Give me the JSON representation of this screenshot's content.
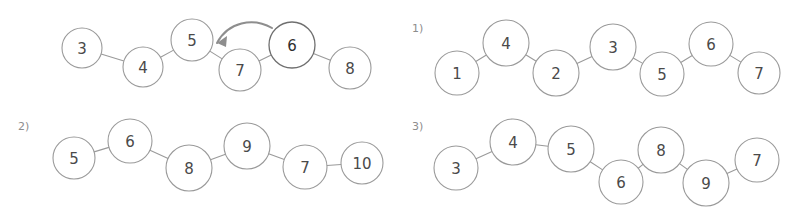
{
  "canvas": {
    "width": 791,
    "height": 213,
    "background": "#ffffff"
  },
  "style": {
    "node_stroke": "#9a9a9a",
    "node_fill": "#ffffff",
    "label_color": "#4a4a4a",
    "edge_color": "#9a9a9a",
    "panel_label_color": "#8d8d8d",
    "arrow_color": "#8e8e8e",
    "shaded_fill": "#8f8f8f",
    "hatch_color": "#d8d8d8"
  },
  "panels": [
    {
      "id": "panel-main",
      "label": "",
      "nodes": [
        {
          "value": "3",
          "cx": 82,
          "cy": 48,
          "r": 20,
          "shaded": false
        },
        {
          "value": "4",
          "cx": 143,
          "cy": 67,
          "r": 20,
          "shaded": false
        },
        {
          "value": "5",
          "cx": 192,
          "cy": 40,
          "r": 21,
          "shaded": false
        },
        {
          "value": "7",
          "cx": 240,
          "cy": 70,
          "r": 21,
          "shaded": false
        },
        {
          "value": "6",
          "cx": 292,
          "cy": 45,
          "r": 23,
          "shaded": true
        },
        {
          "value": "8",
          "cx": 350,
          "cy": 68,
          "r": 21,
          "shaded": false
        }
      ],
      "edges": [
        {
          "from": 0,
          "to": 1
        },
        {
          "from": 1,
          "to": 2
        },
        {
          "from": 2,
          "to": 3
        },
        {
          "from": 3,
          "to": 4
        },
        {
          "from": 4,
          "to": 5
        }
      ],
      "arrow": {
        "label": "move-6-left-arrow",
        "from_node": "6",
        "to_between": "5-and-7",
        "path": "M 272 28 C 253 17 228 22 217 43",
        "head": "217,43 227,36 226,47"
      }
    },
    {
      "id": "panel-1",
      "label": "1)",
      "label_x": 412,
      "label_y": 28,
      "nodes": [
        {
          "value": "1",
          "cx": 457,
          "cy": 73,
          "r": 22,
          "shaded": false
        },
        {
          "value": "4",
          "cx": 506,
          "cy": 43,
          "r": 23,
          "shaded": false
        },
        {
          "value": "2",
          "cx": 556,
          "cy": 73,
          "r": 23,
          "shaded": false
        },
        {
          "value": "3",
          "cx": 613,
          "cy": 47,
          "r": 23,
          "shaded": false
        },
        {
          "value": "5",
          "cx": 662,
          "cy": 74,
          "r": 22,
          "shaded": false
        },
        {
          "value": "6",
          "cx": 711,
          "cy": 44,
          "r": 22,
          "shaded": false
        },
        {
          "value": "7",
          "cx": 759,
          "cy": 73,
          "r": 21,
          "shaded": false
        }
      ],
      "edges": [
        {
          "from": 0,
          "to": 1
        },
        {
          "from": 1,
          "to": 2
        },
        {
          "from": 2,
          "to": 3
        },
        {
          "from": 3,
          "to": 4
        },
        {
          "from": 4,
          "to": 5
        },
        {
          "from": 5,
          "to": 6
        }
      ]
    },
    {
      "id": "panel-2",
      "label": "2)",
      "label_x": 18,
      "label_y": 126,
      "nodes": [
        {
          "value": "5",
          "cx": 74,
          "cy": 158,
          "r": 21,
          "shaded": false
        },
        {
          "value": "6",
          "cx": 130,
          "cy": 141,
          "r": 22,
          "shaded": false
        },
        {
          "value": "8",
          "cx": 189,
          "cy": 168,
          "r": 23,
          "shaded": false
        },
        {
          "value": "9",
          "cx": 247,
          "cy": 146,
          "r": 23,
          "shaded": false
        },
        {
          "value": "7",
          "cx": 305,
          "cy": 167,
          "r": 22,
          "shaded": false
        },
        {
          "value": "10",
          "cx": 362,
          "cy": 163,
          "r": 21,
          "shaded": false
        }
      ],
      "edges": [
        {
          "from": 0,
          "to": 1
        },
        {
          "from": 1,
          "to": 2
        },
        {
          "from": 2,
          "to": 3
        },
        {
          "from": 3,
          "to": 4
        },
        {
          "from": 4,
          "to": 5
        }
      ]
    },
    {
      "id": "panel-3",
      "label": "3)",
      "label_x": 412,
      "label_y": 126,
      "nodes": [
        {
          "value": "3",
          "cx": 456,
          "cy": 168,
          "r": 22,
          "shaded": false
        },
        {
          "value": "4",
          "cx": 513,
          "cy": 142,
          "r": 23,
          "shaded": false
        },
        {
          "value": "5",
          "cx": 571,
          "cy": 149,
          "r": 23,
          "shaded": false
        },
        {
          "value": "6",
          "cx": 621,
          "cy": 182,
          "r": 22,
          "shaded": false
        },
        {
          "value": "8",
          "cx": 661,
          "cy": 150,
          "r": 23,
          "shaded": false
        },
        {
          "value": "9",
          "cx": 706,
          "cy": 183,
          "r": 23,
          "shaded": false
        },
        {
          "value": "7",
          "cx": 757,
          "cy": 160,
          "r": 22,
          "shaded": false
        }
      ],
      "edges": [
        {
          "from": 0,
          "to": 1
        },
        {
          "from": 1,
          "to": 2
        },
        {
          "from": 2,
          "to": 3
        },
        {
          "from": 3,
          "to": 4
        },
        {
          "from": 4,
          "to": 5
        },
        {
          "from": 5,
          "to": 6
        }
      ]
    }
  ]
}
